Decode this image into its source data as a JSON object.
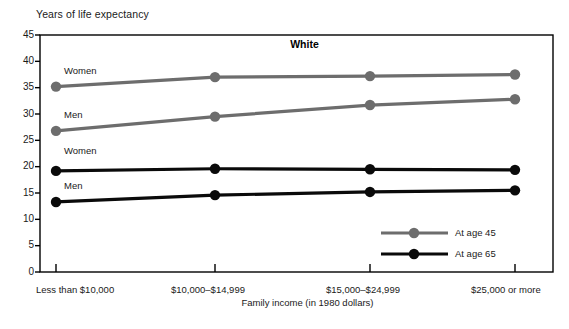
{
  "figure": {
    "y_axis_title": "Years of life expectancy",
    "x_axis_title": "Family income (in 1980 dollars)",
    "title": "White"
  },
  "annotations": [
    {
      "text": "Women",
      "series": "At age 45"
    },
    {
      "text": "Men",
      "series": "At age 45"
    },
    {
      "text": "Women",
      "series": "At age 65"
    },
    {
      "text": "Men",
      "series": "At age 65"
    }
  ],
  "legend": {
    "position": "inside-bottom-right",
    "items": [
      {
        "label": "At age 45",
        "color": "#6d6d6d"
      },
      {
        "label": "At age 65",
        "color": "#0a0a0a"
      }
    ]
  },
  "colors": {
    "age45": "#6d6d6d",
    "age65": "#0a0a0a",
    "axis": "#000000",
    "background": "#ffffff"
  },
  "chart_data": {
    "type": "line",
    "title": "White",
    "xlabel": "Family income (in 1980 dollars)",
    "ylabel": "Years of life expectancy",
    "categories": [
      "Less than $10,000",
      "$10,000–$14,999",
      "$15,000–$24,999",
      "$25,000 or more"
    ],
    "yticks": [
      0,
      5,
      10,
      15,
      20,
      25,
      30,
      35,
      40,
      45
    ],
    "ylim": [
      0,
      45
    ],
    "grid": false,
    "legend": [
      "At age 45",
      "At age 65"
    ],
    "series": [
      {
        "name": "Women, at age 45",
        "group": "At age 45",
        "values": [
          35.2,
          37.0,
          37.2,
          37.5
        ]
      },
      {
        "name": "Men, at age 45",
        "group": "At age 45",
        "values": [
          26.8,
          29.5,
          31.7,
          32.8
        ]
      },
      {
        "name": "Women, at age 65",
        "group": "At age 65",
        "values": [
          19.2,
          19.6,
          19.5,
          19.4
        ]
      },
      {
        "name": "Men, at age 65",
        "group": "At age 65",
        "values": [
          13.3,
          14.6,
          15.2,
          15.5
        ]
      }
    ]
  }
}
